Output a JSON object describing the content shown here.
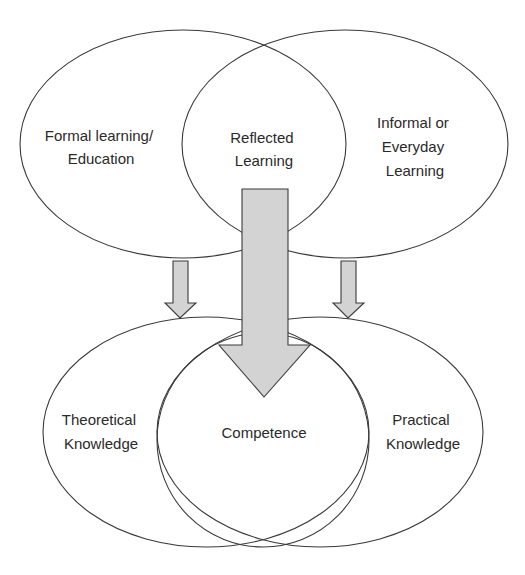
{
  "diagram": {
    "type": "venn-flow",
    "top_sets": [
      {
        "id": "formal",
        "lines": [
          "Formal learning/",
          "Education"
        ]
      },
      {
        "id": "reflected",
        "lines": [
          "Reflected",
          "Learning"
        ]
      },
      {
        "id": "informal",
        "lines": [
          "Informal or",
          "Everyday",
          "Learning"
        ]
      }
    ],
    "bottom_sets": [
      {
        "id": "theoretical",
        "lines": [
          "Theoretical",
          "Knowledge"
        ]
      },
      {
        "id": "competence",
        "lines": [
          "Competence"
        ]
      },
      {
        "id": "practical",
        "lines": [
          "Practical",
          "Knowledge"
        ]
      }
    ],
    "arrows": [
      {
        "from": "Formal learning/ Education",
        "to": "Theoretical Knowledge",
        "size": "small"
      },
      {
        "from": "Reflected Learning",
        "to": "Competence",
        "size": "large"
      },
      {
        "from": "Informal or Everyday Learning",
        "to": "Practical Knowledge",
        "size": "small"
      }
    ],
    "colors": {
      "outline": "#3a3a3a",
      "arrow_fill": "#d3d3d3",
      "text": "#2a2a2a",
      "background": "#ffffff"
    }
  }
}
